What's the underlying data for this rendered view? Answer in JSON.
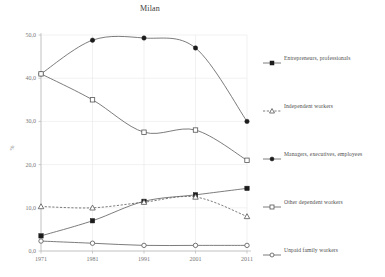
{
  "chart_data": {
    "type": "line",
    "title": "Milan",
    "xlabel": "",
    "ylabel": "%",
    "x": [
      "1971",
      "1981",
      "1991",
      "2001",
      "2011"
    ],
    "categories": [
      "1971",
      "1981",
      "1991",
      "2001",
      "2011"
    ],
    "ylim": [
      0.0,
      50.0
    ],
    "yticks": [
      "0,0",
      "10,0",
      "20,0",
      "30,0",
      "40,0",
      "50,0"
    ],
    "ytick_values": [
      0.0,
      10.0,
      20.0,
      30.0,
      40.0,
      50.0
    ],
    "grid": true,
    "legend_position": "right",
    "series": [
      {
        "name": "Entrepreneurs, professionals",
        "marker": "filled-square",
        "linestyle": "solid",
        "values": [
          3.5,
          7.0,
          11.5,
          13.0,
          14.5
        ]
      },
      {
        "name": "Independent workers",
        "marker": "open-triangle",
        "linestyle": "dashed",
        "values": [
          10.3,
          10.0,
          11.3,
          12.5,
          8.0
        ]
      },
      {
        "name": "Managers, executives, employees",
        "marker": "filled-circle",
        "linestyle": "solid",
        "values": [
          41.0,
          48.8,
          49.3,
          47.0,
          30.0
        ]
      },
      {
        "name": "Other dependent workers",
        "marker": "open-square",
        "linestyle": "solid",
        "values": [
          41.0,
          35.0,
          27.5,
          28.0,
          21.0
        ]
      },
      {
        "name": "Unpaid family workers",
        "marker": "open-circle",
        "linestyle": "solid",
        "values": [
          2.3,
          1.8,
          1.3,
          1.3,
          1.3
        ]
      }
    ],
    "colors": {
      "line": "#5a5a5a",
      "grid": "#e8e8e8",
      "axis": "#b4b4b4",
      "text": "#4d4d4d",
      "background": "#ffffff"
    }
  }
}
